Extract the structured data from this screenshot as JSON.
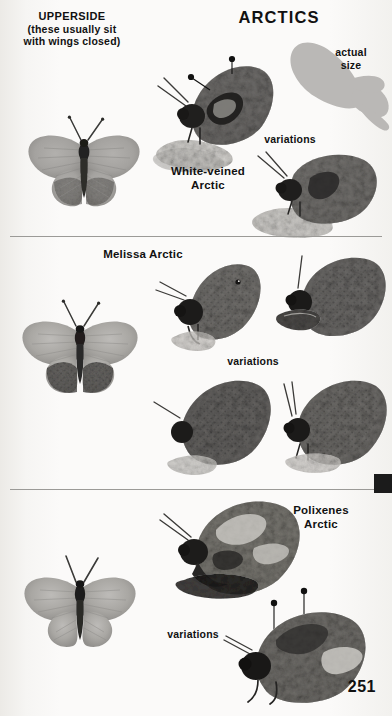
{
  "page": {
    "number": "251",
    "plate_title": "ARCTICS",
    "background_color": "#f7f6f4",
    "ink_color": "#111111",
    "divider_color": "#9b9a97",
    "tab_color": "#1b1b1b"
  },
  "upperside": {
    "heading": "UPPERSIDE",
    "note": "(these usually sit\nwith wings closed)"
  },
  "actual_size": {
    "label": "actual\nsize",
    "silhouette_color": "#b9b8b6"
  },
  "sections": [
    {
      "id": "white-veined-arctic",
      "species_label": "White-veined\nArctic",
      "variations_label": "variations",
      "upperside_specimens": 1,
      "underside_specimens": 2
    },
    {
      "id": "melissa-arctic",
      "species_label": "Melissa Arctic",
      "variations_label": "variations",
      "upperside_specimens": 1,
      "underside_specimens": 4
    },
    {
      "id": "polixenes-arctic",
      "species_label": "Polixenes\nArctic",
      "variations_label": "variations",
      "upperside_specimens": 1,
      "underside_specimens": 2
    }
  ]
}
